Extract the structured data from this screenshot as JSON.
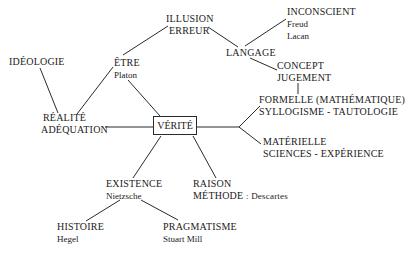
{
  "diagram": {
    "center": {
      "label": "VÉRITÉ"
    },
    "nodes": {
      "illusion": {
        "lines": [
          "ILLUSION",
          "ERREUR"
        ]
      },
      "inconscient": {
        "label": "INCONSCIENT",
        "subs": [
          "Freud",
          "Lacan"
        ]
      },
      "langage": {
        "label": "LANGAGE"
      },
      "concept": {
        "lines": [
          "CONCEPT",
          "JUGEMENT"
        ]
      },
      "ideologie": {
        "label": "IDÉOLOGIE"
      },
      "etre": {
        "label": "ÊTRE",
        "sub": "Platon"
      },
      "realite": {
        "lines": [
          "RÉALITÉ",
          "ADÉQUATION"
        ]
      },
      "formelle": {
        "lines": [
          "FORMELLE (MATHÉMATIQUE)",
          "SYLLOGISME - TAUTOLOGIE"
        ]
      },
      "materielle": {
        "lines": [
          "MATÉRIELLE",
          "SCIENCES - EXPÉRIENCE"
        ]
      },
      "existence": {
        "label": "EXISTENCE",
        "sub": "Nietzsche"
      },
      "raison": {
        "label": "RAISON",
        "label2": "MÉTHODE",
        "sub": ": Descartes"
      },
      "histoire": {
        "label": "HISTOIRE",
        "sub": "Hegel"
      },
      "pragmatisme": {
        "label": "PRAGMATISME",
        "sub": "Stuart Mill"
      }
    },
    "edges": [
      [
        "ÊTRE",
        "ILLUSION/ERREUR"
      ],
      [
        "ILLUSION/ERREUR",
        "LANGAGE"
      ],
      [
        "LANGAGE",
        "INCONSCIENT"
      ],
      [
        "LANGAGE",
        "CONCEPT/JUGEMENT"
      ],
      [
        "CONCEPT/JUGEMENT",
        "FORMELLE"
      ],
      [
        "IDÉOLOGIE",
        "RÉALITÉ"
      ],
      [
        "RÉALITÉ",
        "ÊTRE"
      ],
      [
        "ÊTRE",
        "VÉRITÉ"
      ],
      [
        "RÉALITÉ",
        "VÉRITÉ"
      ],
      [
        "VÉRITÉ",
        "FORMELLE"
      ],
      [
        "VÉRITÉ",
        "MATÉRIELLE"
      ],
      [
        "VÉRITÉ",
        "EXISTENCE"
      ],
      [
        "VÉRITÉ",
        "RAISON"
      ],
      [
        "EXISTENCE",
        "HISTOIRE"
      ],
      [
        "EXISTENCE",
        "PRAGMATISME"
      ]
    ]
  }
}
